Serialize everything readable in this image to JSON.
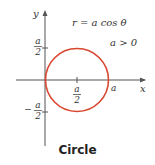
{
  "figure": {
    "equation": "r = a cos θ",
    "condition": "a > 0",
    "caption": "Circle",
    "axes": {
      "x_label": "x",
      "y_label": "y"
    },
    "ticks": {
      "y_pos": {
        "num": "a",
        "den": "2"
      },
      "y_neg": {
        "sign": "−",
        "num": "a",
        "den": "2"
      },
      "x_mid": {
        "num": "a",
        "den": "2"
      },
      "x_end": "a"
    },
    "colors": {
      "curve": "#d9472f",
      "axes": "#555555"
    }
  }
}
